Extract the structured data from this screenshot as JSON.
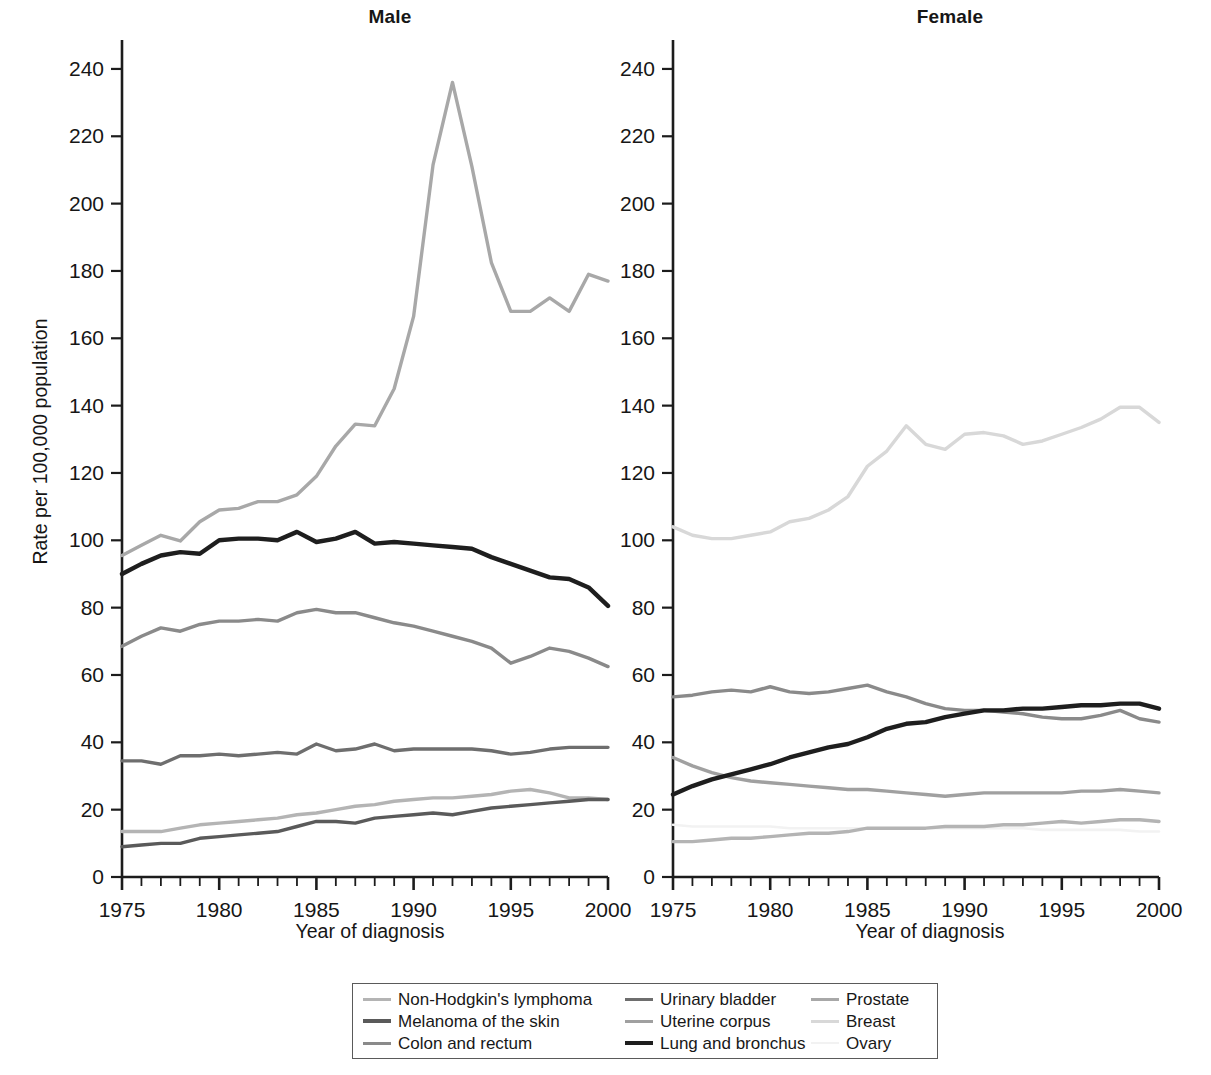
{
  "figure": {
    "panels": [
      {
        "key": "male",
        "title": "Male",
        "xlabel": "Year of diagnosis"
      },
      {
        "key": "female",
        "title": "Female",
        "xlabel": "Year of diagnosis"
      }
    ],
    "ylabel": "Rate per 100,000 population"
  },
  "legend": {
    "entries": [
      {
        "label": "Non-Hodgkin's lymphoma",
        "color": "#b4b4b4",
        "width": 3.2
      },
      {
        "label": "Urinary bladder",
        "color": "#6e6e6e",
        "width": 3.6
      },
      {
        "label": "Prostate",
        "color": "#a8a8a8",
        "width": 3.2
      },
      {
        "label": "Melanoma of the skin",
        "color": "#5a5a5a",
        "width": 4.2
      },
      {
        "label": "Uterine corpus",
        "color": "#a0a0a0",
        "width": 3.0
      },
      {
        "label": "Breast",
        "color": "#d8d8d8",
        "width": 3.0
      },
      {
        "label": "Colon and rectum",
        "color": "#8a8a8a",
        "width": 3.4
      },
      {
        "label": "Lung and bronchus",
        "color": "#1e1e1e",
        "width": 4.4
      },
      {
        "label": "Ovary",
        "color": "#f2f2f2",
        "width": 2.6
      }
    ]
  },
  "chart_data": [
    {
      "type": "line",
      "title": "Male",
      "xlabel": "Year of diagnosis",
      "ylabel": "Rate per 100,000 population",
      "xlim": [
        1975,
        2000
      ],
      "ylim": [
        0,
        248
      ],
      "yticks": [
        0,
        20,
        40,
        60,
        80,
        100,
        120,
        140,
        160,
        180,
        200,
        220,
        240
      ],
      "xticks": [
        1975,
        1980,
        1985,
        1990,
        1995,
        2000
      ],
      "xminor_step": 1,
      "grid": false,
      "legend_position": "below-figure",
      "x": [
        1975,
        1976,
        1977,
        1978,
        1979,
        1980,
        1981,
        1982,
        1983,
        1984,
        1985,
        1986,
        1987,
        1988,
        1989,
        1990,
        1991,
        1992,
        1993,
        1994,
        1995,
        1996,
        1997,
        1998,
        1999,
        2000
      ],
      "series": [
        {
          "name": "Prostate",
          "color": "#a8a8a8",
          "values": [
            95.5,
            98.5,
            101.5,
            99.8,
            105.5,
            109.0,
            109.5,
            111.5,
            111.5,
            113.5,
            119.0,
            128.0,
            134.5,
            134.0,
            145.0,
            166.5,
            211.5,
            236.0,
            211.0,
            182.5,
            168.0,
            168.0,
            172.0,
            168.0,
            179.0,
            177.0
          ]
        },
        {
          "name": "Lung and bronchus",
          "color": "#1e1e1e",
          "values": [
            90.0,
            93.0,
            95.5,
            96.5,
            96.0,
            100.0,
            100.5,
            100.5,
            100.0,
            102.5,
            99.5,
            100.5,
            102.5,
            99.0,
            99.5,
            99.0,
            98.5,
            98.0,
            97.5,
            95.0,
            93.0,
            91.0,
            89.0,
            88.5,
            86.0,
            80.5
          ]
        },
        {
          "name": "Colon and rectum",
          "color": "#8a8a8a",
          "values": [
            68.5,
            71.5,
            74.0,
            73.0,
            75.0,
            76.0,
            76.0,
            76.5,
            76.0,
            78.5,
            79.5,
            78.5,
            78.5,
            77.0,
            75.5,
            74.5,
            73.0,
            71.5,
            70.0,
            68.0,
            63.5,
            65.5,
            68.0,
            67.0,
            65.0,
            62.5
          ]
        },
        {
          "name": "Urinary bladder",
          "color": "#6e6e6e",
          "values": [
            34.5,
            34.5,
            33.5,
            36.0,
            36.0,
            36.5,
            36.0,
            36.5,
            37.0,
            36.5,
            39.5,
            37.5,
            38.0,
            39.5,
            37.5,
            38.0,
            38.0,
            38.0,
            38.0,
            37.5,
            36.5,
            37.0,
            38.0,
            38.5,
            38.5,
            38.5
          ]
        },
        {
          "name": "Non-Hodgkin's lymphoma",
          "color": "#b4b4b4",
          "values": [
            13.5,
            13.5,
            13.5,
            14.5,
            15.5,
            16.0,
            16.5,
            17.0,
            17.5,
            18.5,
            19.0,
            20.0,
            21.0,
            21.5,
            22.5,
            23.0,
            23.5,
            23.5,
            24.0,
            24.5,
            25.5,
            26.0,
            25.0,
            23.5,
            23.5,
            23.0
          ]
        },
        {
          "name": "Melanoma of the skin",
          "color": "#5a5a5a",
          "values": [
            9.0,
            9.5,
            10.0,
            10.0,
            11.5,
            12.0,
            12.5,
            13.0,
            13.5,
            15.0,
            16.5,
            16.5,
            16.0,
            17.5,
            18.0,
            18.5,
            19.0,
            18.5,
            19.5,
            20.5,
            21.0,
            21.5,
            22.0,
            22.5,
            23.0,
            23.0
          ]
        }
      ]
    },
    {
      "type": "line",
      "title": "Female",
      "xlabel": "Year of diagnosis",
      "ylabel": "Rate per 100,000 population",
      "xlim": [
        1975,
        2000
      ],
      "ylim": [
        0,
        248
      ],
      "yticks": [
        0,
        20,
        40,
        60,
        80,
        100,
        120,
        140,
        160,
        180,
        200,
        220,
        240
      ],
      "xticks": [
        1975,
        1980,
        1985,
        1990,
        1995,
        2000
      ],
      "xminor_step": 1,
      "grid": false,
      "legend_position": "below-figure",
      "x": [
        1975,
        1976,
        1977,
        1978,
        1979,
        1980,
        1981,
        1982,
        1983,
        1984,
        1985,
        1986,
        1987,
        1988,
        1989,
        1990,
        1991,
        1992,
        1993,
        1994,
        1995,
        1996,
        1997,
        1998,
        1999,
        2000
      ],
      "series": [
        {
          "name": "Breast",
          "color": "#d8d8d8",
          "values": [
            104.0,
            101.5,
            100.5,
            100.5,
            101.5,
            102.5,
            105.5,
            106.5,
            109.0,
            113.0,
            122.0,
            126.5,
            134.0,
            128.5,
            127.0,
            131.5,
            132.0,
            131.0,
            128.5,
            129.5,
            131.5,
            133.5,
            136.0,
            139.5,
            139.5,
            135.0
          ]
        },
        {
          "name": "Colon and rectum",
          "color": "#8a8a8a",
          "values": [
            53.5,
            54.0,
            55.0,
            55.5,
            55.0,
            56.5,
            55.0,
            54.5,
            55.0,
            56.0,
            57.0,
            55.0,
            53.5,
            51.5,
            50.0,
            49.5,
            49.5,
            49.0,
            48.5,
            47.5,
            47.0,
            47.0,
            48.0,
            49.5,
            47.0,
            46.0
          ]
        },
        {
          "name": "Lung and bronchus",
          "color": "#1e1e1e",
          "values": [
            24.5,
            27.0,
            29.0,
            30.5,
            32.0,
            33.5,
            35.5,
            37.0,
            38.5,
            39.5,
            41.5,
            44.0,
            45.5,
            46.0,
            47.5,
            48.5,
            49.5,
            49.5,
            50.0,
            50.0,
            50.5,
            51.0,
            51.0,
            51.5,
            51.5,
            50.0
          ]
        },
        {
          "name": "Uterine corpus",
          "color": "#a0a0a0",
          "values": [
            35.5,
            33.0,
            31.0,
            29.5,
            28.5,
            28.0,
            27.5,
            27.0,
            26.5,
            26.0,
            26.0,
            25.5,
            25.0,
            24.5,
            24.0,
            24.5,
            25.0,
            25.0,
            25.0,
            25.0,
            25.0,
            25.5,
            25.5,
            26.0,
            25.5,
            25.0
          ]
        },
        {
          "name": "Non-Hodgkin's lymphoma",
          "color": "#b4b4b4",
          "values": [
            10.5,
            10.5,
            11.0,
            11.5,
            11.5,
            12.0,
            12.5,
            13.0,
            13.0,
            13.5,
            14.5,
            14.5,
            14.5,
            14.5,
            15.0,
            15.0,
            15.0,
            15.5,
            15.5,
            16.0,
            16.5,
            16.0,
            16.5,
            17.0,
            17.0,
            16.5
          ]
        },
        {
          "name": "Ovary",
          "color": "#f2f2f2",
          "values": [
            15.5,
            15.0,
            15.0,
            15.0,
            15.0,
            15.0,
            14.5,
            14.5,
            14.5,
            14.5,
            14.5,
            14.5,
            14.5,
            14.5,
            14.5,
            14.5,
            14.5,
            14.5,
            14.5,
            14.0,
            14.0,
            14.0,
            14.0,
            14.0,
            13.5,
            13.5
          ]
        }
      ]
    }
  ]
}
